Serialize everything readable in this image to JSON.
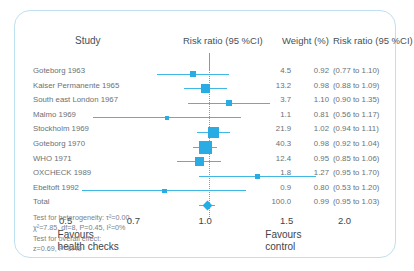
{
  "header": {
    "study": "Study",
    "plot_title": "Risk ratio  (95 %CI)",
    "weight": "Weight  (%)",
    "risk_ratio": "Risk ratio  (95 %CI)"
  },
  "total_label": "Total",
  "axis": {
    "ticks": [
      "0.5",
      "0.7",
      "1.0",
      "1.5",
      "2.0"
    ],
    "tick_values": [
      0.5,
      0.7,
      1.0,
      1.5,
      2.0
    ],
    "favours_left_line1": "Favours",
    "favours_left_line2": "health checks",
    "favours_right_line1": "Favours",
    "favours_right_line2": "control"
  },
  "stats": {
    "line1": "Test for heterogeneity: τ²=0.00,",
    "line2": "χ²=7.85, df=8, P=0.45, I²=0%",
    "line3": "Test for overall effect:",
    "line4": "z=0.69, P=0.49"
  },
  "colors": {
    "marker": "#29ace3",
    "whisker": "#3fb8e6",
    "nullline": "#35b6e8",
    "border": "#bfe0ee",
    "text": "#6c7175"
  },
  "chart_data": {
    "type": "forest",
    "title": "Risk ratio  (95 %CI)",
    "xlabel": "Risk ratio",
    "xscale": "log",
    "xlim": [
      0.42,
      2.3
    ],
    "null_value": 1.0,
    "grid": false,
    "studies": [
      {
        "label": "Goteborg 1963",
        "weight": "4.5",
        "weight_value": 4.5,
        "estimate": "0.92",
        "est_value": 0.92,
        "ci": "(0.77 to 1.10)",
        "lower": 0.77,
        "upper": 1.1
      },
      {
        "label": "Kaiser Permanente 1965",
        "weight": "13.2",
        "weight_value": 13.2,
        "estimate": "0.98",
        "est_value": 0.98,
        "ci": "(0.88 to 1.09)",
        "lower": 0.88,
        "upper": 1.09
      },
      {
        "label": "South east London 1967",
        "weight": "3.7",
        "weight_value": 3.7,
        "estimate": "1.10",
        "est_value": 1.1,
        "ci": "(0.90 to 1.35)",
        "lower": 0.9,
        "upper": 1.35
      },
      {
        "label": "Malmo 1969",
        "weight": "1.1",
        "weight_value": 1.1,
        "estimate": "0.81",
        "est_value": 0.81,
        "ci": "(0.56 to 1.17)",
        "lower": 0.56,
        "upper": 1.17
      },
      {
        "label": "Stockholm 1969",
        "weight": "21.9",
        "weight_value": 21.9,
        "estimate": "1.02",
        "est_value": 1.02,
        "ci": "(0.94 to 1.11)",
        "lower": 0.94,
        "upper": 1.11
      },
      {
        "label": "Goteborg 1970",
        "weight": "40.3",
        "weight_value": 40.3,
        "estimate": "0.98",
        "est_value": 0.98,
        "ci": "(0.92 to 1.04)",
        "lower": 0.92,
        "upper": 1.04
      },
      {
        "label": "WHO 1971",
        "weight": "12.4",
        "weight_value": 12.4,
        "estimate": "0.95",
        "est_value": 0.95,
        "ci": "(0.85 to 1.06)",
        "lower": 0.85,
        "upper": 1.06
      },
      {
        "label": "OXCHECK 1989",
        "weight": "1.8",
        "weight_value": 1.8,
        "estimate": "1.27",
        "est_value": 1.27,
        "ci": "(0.95 to 1.70)",
        "lower": 0.95,
        "upper": 1.7
      },
      {
        "label": "Ebeltoft 1992",
        "weight": "0.9",
        "weight_value": 0.9,
        "estimate": "0.80",
        "est_value": 0.8,
        "ci": "(0.53 to 1.20)",
        "lower": 0.53,
        "upper": 1.2
      }
    ],
    "total": {
      "label": "Total",
      "weight": "100.0",
      "weight_value": 100.0,
      "estimate": "0.99",
      "est_value": 0.99,
      "ci": "(0.95 to 1.03)",
      "lower": 0.95,
      "upper": 1.03
    }
  }
}
